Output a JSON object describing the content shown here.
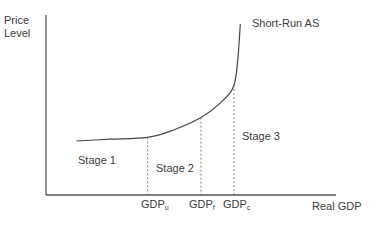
{
  "chart_data": {
    "type": "line",
    "title": "",
    "ylabel_line1": "Price",
    "ylabel_line2": "Level",
    "xlabel": "Real GDP",
    "curve_label": "Short-Run AS",
    "stages": [
      {
        "label": "Stage 1"
      },
      {
        "label": "Stage 2"
      },
      {
        "label": "Stage 3"
      }
    ],
    "x_ticks": [
      {
        "base": "GDP",
        "sub": "u",
        "x": 0.4
      },
      {
        "base": "GDP",
        "sub": "f",
        "x": 0.61
      },
      {
        "base": "GDP",
        "sub": "c",
        "x": 0.74
      }
    ],
    "series": [
      {
        "name": "Short-Run AS",
        "points": [
          [
            0.12,
            0.3
          ],
          [
            0.25,
            0.31
          ],
          [
            0.4,
            0.32
          ],
          [
            0.5,
            0.36
          ],
          [
            0.61,
            0.43
          ],
          [
            0.7,
            0.53
          ],
          [
            0.74,
            0.61
          ],
          [
            0.755,
            0.75
          ],
          [
            0.765,
            0.95
          ]
        ]
      }
    ],
    "xlim": [
      0,
      1
    ],
    "ylim": [
      0,
      1
    ],
    "grid": false
  },
  "colors": {
    "axis": "#555555",
    "curve": "#444444",
    "dashed": "#777777",
    "text": "#3a3a3a"
  }
}
